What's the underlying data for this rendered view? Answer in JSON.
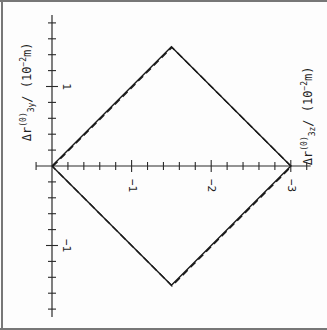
{
  "chart_data": {
    "type": "line",
    "title": "",
    "orientation": "rotated 90° (figure printed sideways)",
    "xlabel": "Δr3z(0) / (10^-2 m)",
    "ylabel": "Δr3y(0) / (10^-2 m)",
    "x_axis": {
      "label_parts": {
        "delta": "Δr",
        "sup": "(0)",
        "sub": "3z",
        "units": "/ (10",
        "exp": "−2",
        "unit_tail": "m)"
      },
      "tick_labels": [
        "−1",
        "−2",
        "−3"
      ],
      "tick_values": [
        -1,
        -2,
        -3
      ],
      "minor_step": 0.2,
      "range": [
        0.2,
        -3.25
      ]
    },
    "y_axis": {
      "label_parts": {
        "delta": "Δr",
        "sup": "(0)",
        "sub": "3y",
        "units": "/ (10",
        "exp": "−2",
        "unit_tail": "m)"
      },
      "tick_labels": [
        "1",
        "−1"
      ],
      "tick_values": [
        1,
        -1
      ],
      "minor_step": 0.2,
      "range": [
        -1.9,
        1.9
      ]
    },
    "series": [
      {
        "name": "exact region boundary",
        "style": "solid",
        "points": [
          [
            0,
            0
          ],
          [
            -1.5,
            1.5
          ],
          [
            -3,
            0
          ],
          [
            -1.5,
            -1.5
          ],
          [
            0,
            0
          ]
        ]
      },
      {
        "name": "approximate boundary",
        "style": "dashed",
        "points": [
          [
            0,
            0
          ],
          [
            -1.5,
            1.5
          ],
          [
            -3,
            0
          ],
          [
            -1.5,
            -1.5
          ],
          [
            0,
            0
          ]
        ]
      }
    ],
    "grid": false,
    "legend": "none",
    "shape": "diamond (square rotated 45°) with vertices at (0,0), (-1.5, 1.5), (-3, 0), (-1.5, -1.5)"
  },
  "colors": {
    "line": "#1a1a1a",
    "axis": "#2a2a2a",
    "frame": "#777777",
    "background": "#fdfdfd"
  }
}
